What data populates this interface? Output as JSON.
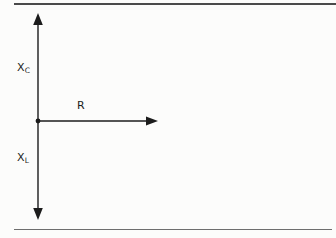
{
  "figure": {
    "type": "axes-diagram",
    "background_color": "#fcfcfb",
    "ink_color": "#1c1c1c",
    "rules": {
      "top_color": "#4a4a4a",
      "bottom_color": "#6e6e6e"
    },
    "labels": {
      "y_top": {
        "base": "X",
        "sub": "C"
      },
      "y_bottom": {
        "base": "X",
        "sub": "L"
      },
      "x_axis": "R"
    },
    "axes": {
      "origin": {
        "x": 38,
        "y": 121
      },
      "vertical_arrow": {
        "top_tip_y": 13,
        "bottom_tip_y": 220,
        "x": 38,
        "double_headed": true
      },
      "horizontal_arrow": {
        "from_x": 38,
        "tip_x": 158,
        "y": 121
      }
    }
  }
}
